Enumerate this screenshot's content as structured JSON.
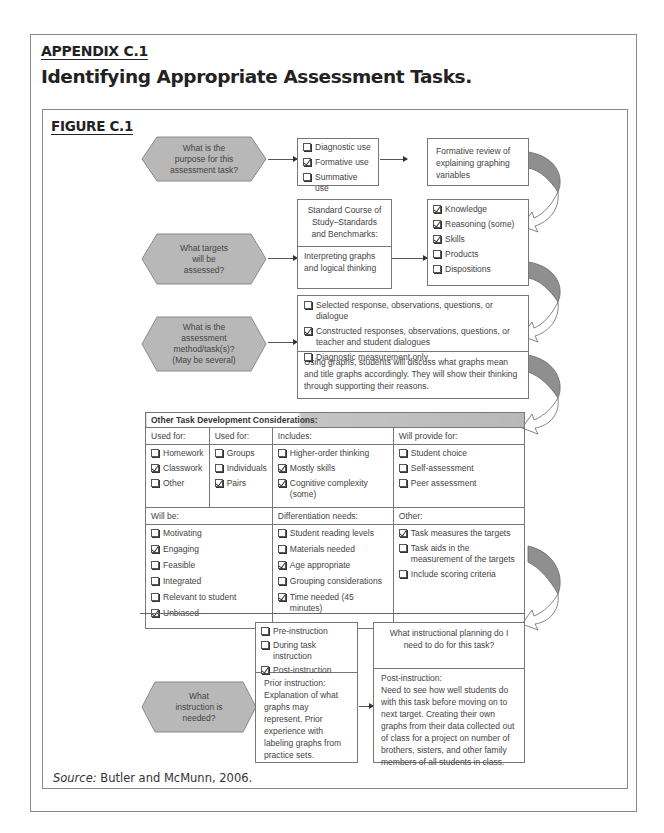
{
  "header": {
    "appendix_label": "APPENDIX C.1",
    "title": "Identifying Appropriate Assessment Tasks.",
    "figure_label": "FIGURE C.1"
  },
  "colors": {
    "hexagon_fill": "#b8b8b8",
    "border": "#777777",
    "shaded_bar": "#c4c4c4",
    "text": "#444444"
  },
  "step1": {
    "question": "What is the purpose for this assessment task?",
    "options": [
      {
        "label": "Diagnostic use",
        "checked": false
      },
      {
        "label": "Formative use",
        "checked": true
      },
      {
        "label": "Summative use",
        "checked": false
      }
    ],
    "result": "Formative review of explaining graphing variables"
  },
  "step2": {
    "question": "What targets will be assessed?",
    "standards_heading": "Standard Course of Study–Standards and Benchmarks:",
    "standards_text": "Interpreting graphs and logical thinking",
    "options": [
      {
        "label": "Knowledge",
        "checked": true
      },
      {
        "label": "Reasoning (some)",
        "checked": true
      },
      {
        "label": "Skills",
        "checked": true
      },
      {
        "label": "Products",
        "checked": false
      },
      {
        "label": "Dispositions",
        "checked": false
      }
    ]
  },
  "step3": {
    "question": "What is the assessment method/task(s)? (May be several)",
    "options": [
      {
        "label": "Selected response, observations, questions, or dialogue",
        "checked": false
      },
      {
        "label": "Constructed responses, observations, questions, or teacher and student dialogues",
        "checked": true
      },
      {
        "label": "Diagnostic measurement only",
        "checked": false
      }
    ],
    "description": "Using graphs, students will discuss what graphs mean and title graphs accordingly. They will show their thinking through supporting their reasons."
  },
  "considerations": {
    "heading": "Other Task Development Considerations:",
    "used_for_1": {
      "label": "Used for:",
      "items": [
        {
          "label": "Homework",
          "checked": false
        },
        {
          "label": "Classwork",
          "checked": true
        },
        {
          "label": "Other",
          "checked": false
        }
      ]
    },
    "used_for_2": {
      "label": "Used for:",
      "items": [
        {
          "label": "Groups",
          "checked": false
        },
        {
          "label": "Individuals",
          "checked": false
        },
        {
          "label": "Pairs",
          "checked": true
        }
      ]
    },
    "includes": {
      "label": "Includes:",
      "items": [
        {
          "label": "Higher-order thinking",
          "checked": false
        },
        {
          "label": "Mostly skills",
          "checked": true
        },
        {
          "label": "Cognitive complexity (some)",
          "checked": true
        }
      ]
    },
    "will_provide": {
      "label": "Will provide for:",
      "items": [
        {
          "label": "Student choice",
          "checked": false
        },
        {
          "label": "Self-assessment",
          "checked": false
        },
        {
          "label": "Peer assessment",
          "checked": false
        }
      ]
    },
    "will_be": {
      "label": "Will be:",
      "items": [
        {
          "label": "Motivating",
          "checked": false
        },
        {
          "label": "Engaging",
          "checked": true
        },
        {
          "label": "Feasible",
          "checked": false
        },
        {
          "label": "Integrated",
          "checked": false
        },
        {
          "label": "Relevant to student",
          "checked": false
        },
        {
          "label": "Unbiased",
          "checked": true
        }
      ]
    },
    "differentiation": {
      "label": "Differentiation needs:",
      "items": [
        {
          "label": "Student reading levels",
          "checked": false
        },
        {
          "label": "Materials needed",
          "checked": false
        },
        {
          "label": "Age appropriate",
          "checked": true
        },
        {
          "label": "Grouping considerations",
          "checked": false
        },
        {
          "label": "Time needed (45 minutes)",
          "checked": true
        }
      ]
    },
    "other": {
      "label": "Other:",
      "items": [
        {
          "label": "Task measures the targets",
          "checked": true
        },
        {
          "label": "Task aids in the measurement of the targets",
          "checked": false
        },
        {
          "label": "Include scoring criteria",
          "checked": false
        }
      ]
    }
  },
  "step4": {
    "question": "What instruction is needed?",
    "options": [
      {
        "label": "Pre-instruction",
        "checked": false
      },
      {
        "label": "During task instruction",
        "checked": false
      },
      {
        "label": "Post-instruction",
        "checked": true
      }
    ],
    "prior_text": "Prior instruction: Explanation of what graphs may represent. Prior experience with labeling graphs from practice sets.",
    "planning_heading": "What instructional planning do I need to do for this task?",
    "planning_label": "Post-instruction:",
    "planning_text": "Need to see how well students do with this task before moving on to next target. Creating their own graphs from their data collected out of class for a project on number of brothers, sisters, and other family members of all students in class."
  },
  "source": {
    "label": "Source:",
    "text": " Butler and McMunn, 2006."
  }
}
